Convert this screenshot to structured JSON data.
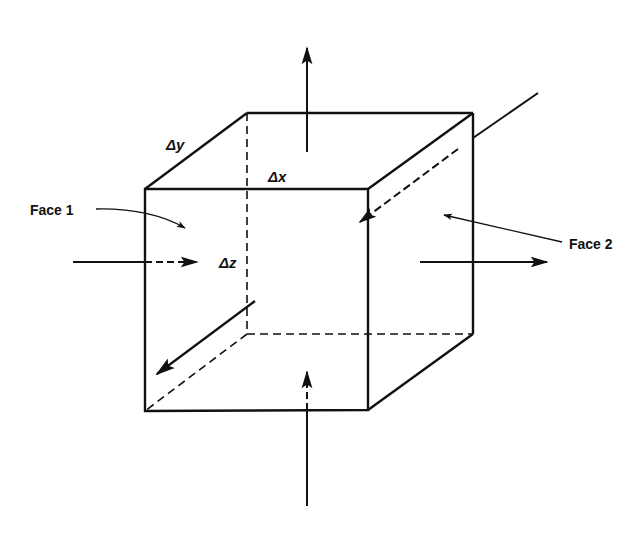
{
  "figure": {
    "colors": {
      "line": "#111111",
      "background": "#ffffff"
    }
  },
  "labels": {
    "face1": "Face 1",
    "face2": "Face 2",
    "dx": "Δx",
    "dy": "Δy",
    "dz": "Δz"
  },
  "cube": {
    "front_face": {
      "top_left": [
        145,
        189
      ],
      "top_right": [
        368,
        189
      ],
      "bottom_right": [
        368,
        410
      ],
      "bottom_left": [
        145,
        411
      ]
    },
    "back_face": {
      "top_left": [
        247,
        113
      ],
      "top_right": [
        473,
        113
      ],
      "bottom_right": [
        473,
        334
      ],
      "bottom_left": [
        247,
        334
      ]
    },
    "hidden_edges": "dashed"
  },
  "arrows": [
    {
      "name": "x-flux-in",
      "direction": "right",
      "from": [
        73,
        262
      ],
      "to": [
        197,
        262
      ]
    },
    {
      "name": "x-flux-out",
      "direction": "right",
      "from": [
        420,
        262
      ],
      "to": [
        547,
        262
      ]
    },
    {
      "name": "z-flux-out-top",
      "direction": "up",
      "from": [
        307,
        152
      ],
      "to": [
        307,
        48
      ]
    },
    {
      "name": "z-flux-in-bottom",
      "direction": "up",
      "from": [
        307,
        506
      ],
      "to": [
        307,
        372
      ]
    },
    {
      "name": "y-flux-in-back",
      "direction": "down-left",
      "from": [
        538,
        93
      ],
      "to": [
        360,
        222
      ]
    },
    {
      "name": "y-flux-out-front",
      "direction": "down-left",
      "from": [
        255,
        301
      ],
      "to": [
        157,
        374
      ]
    }
  ]
}
